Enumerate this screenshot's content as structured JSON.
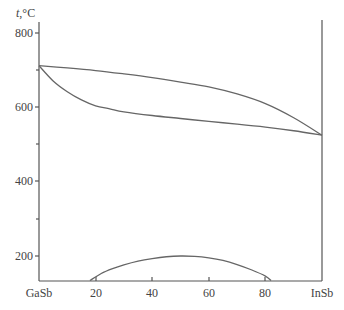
{
  "chart_data": {
    "type": "line",
    "title": "",
    "subtitle": "GaSb–InSb phase diagram",
    "xlabel": "",
    "ylabel": "t,°C",
    "x_end_labels": {
      "left": "GaSb",
      "right": "InSb"
    },
    "xticks": [
      20,
      40,
      60,
      80
    ],
    "yticks": [
      200,
      400,
      600,
      800
    ],
    "xlim": [
      0,
      100
    ],
    "ylim": [
      134,
      800
    ],
    "grid": false,
    "legend": null,
    "series": [
      {
        "name": "liquidus",
        "x": [
          0,
          10,
          20,
          30,
          40,
          50,
          60,
          70,
          80,
          90,
          100
        ],
        "y": [
          712,
          706,
          699,
          690,
          680,
          668,
          655,
          636,
          610,
          572,
          525
        ]
      },
      {
        "name": "solidus",
        "x": [
          0,
          5,
          10,
          15,
          20,
          25,
          30,
          40,
          50,
          60,
          70,
          80,
          90,
          100
        ],
        "y": [
          712,
          671,
          642,
          620,
          604,
          596,
          588,
          578,
          570,
          562,
          555,
          547,
          537,
          525
        ]
      },
      {
        "name": "miscibility gap",
        "x": [
          18,
          22,
          26,
          30,
          35,
          40,
          45,
          50,
          55,
          60,
          65,
          70,
          75,
          80,
          82
        ],
        "y": [
          134,
          153,
          166,
          176,
          186,
          193,
          198,
          200,
          199,
          195,
          188,
          177,
          163,
          146,
          134
        ]
      }
    ],
    "annotations": []
  },
  "axes": {
    "y_title": "t,°C",
    "y_ticks": [
      "800",
      "600",
      "400",
      "200"
    ],
    "x_left_label": "GaSb",
    "x_right_label": "InSb",
    "x_ticks": [
      "20",
      "40",
      "60",
      "80"
    ]
  },
  "colors": {
    "axis": "#555555",
    "curve": "#666666",
    "text": "#444444"
  }
}
